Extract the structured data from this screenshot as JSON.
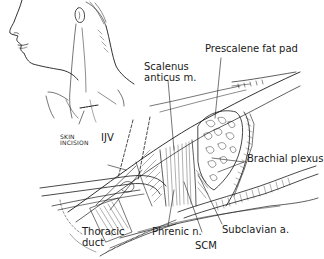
{
  "figure": {
    "type": "surgical anatomy illustration",
    "colors": {
      "ink": "#1a1a1a",
      "background": "#ffffff"
    },
    "inset": {
      "description": "head and neck profile with skin incision marked",
      "label_line1": "SKIN",
      "label_line2": "INCISION"
    },
    "labels": {
      "scalenus_line1": "Scalenus",
      "scalenus_line2": "anticus m.",
      "prescalene": "Prescalene fat pad",
      "ijv": "IJV",
      "brachial": "Brachial plexus",
      "thoracic_line1": "Thoracic",
      "thoracic_line2": "duct",
      "phrenic": "Phrenic n.",
      "subclavian": "Subclavian a.",
      "scm": "SCM"
    }
  }
}
